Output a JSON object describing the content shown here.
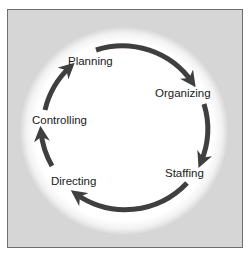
{
  "diagram": {
    "colors": {
      "background": "#d6d6d6",
      "ring": "#ffffff",
      "arrow": "#3f3f3f",
      "text": "#1a1a1a"
    },
    "stages": [
      {
        "label": "Planning"
      },
      {
        "label": "Organizing"
      },
      {
        "label": "Staffing"
      },
      {
        "label": "Directing"
      },
      {
        "label": "Controlling"
      }
    ],
    "flow": "clockwise"
  }
}
